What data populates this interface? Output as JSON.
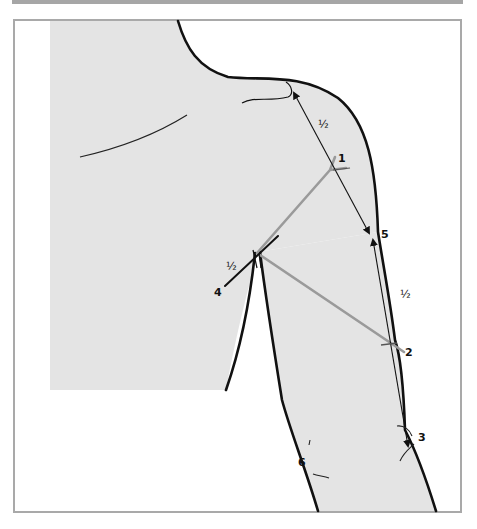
{
  "figure": {
    "colors": {
      "background": "#ffffff",
      "frame_border": "#a9a9a9",
      "top_bar": "#a6a6a6",
      "body_fill": "#e4e4e4",
      "outline": "#111111",
      "guide_line": "#9a9a9a",
      "measure_line": "#222222"
    },
    "points": [
      {
        "id": "1",
        "label": "1"
      },
      {
        "id": "2",
        "label": "2"
      },
      {
        "id": "3",
        "label": "3"
      },
      {
        "id": "4",
        "label": "4"
      },
      {
        "id": "5",
        "label": "5"
      },
      {
        "id": "6",
        "label": "6"
      }
    ],
    "fractions": [
      {
        "id": "half-shoulder",
        "label": "½"
      },
      {
        "id": "half-armpit",
        "label": "½"
      },
      {
        "id": "half-upper-arm",
        "label": "½"
      }
    ]
  }
}
